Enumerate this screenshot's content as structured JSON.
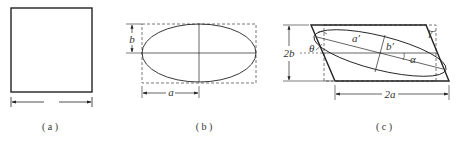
{
  "panels": [
    {
      "id": "a",
      "caption": "( a )"
    },
    {
      "id": "b",
      "caption": "( b )",
      "labels": {
        "semi_minor": "b",
        "semi_major": "a"
      }
    },
    {
      "id": "c",
      "caption": "( c )",
      "labels": {
        "height": "2b",
        "width": "2a",
        "semi_major_prime": "a′",
        "semi_minor_prime": "b′",
        "rotation": "α",
        "shear_angle": "θ",
        "shear_strain": "γ"
      }
    }
  ],
  "colors": {
    "stroke": "#222222",
    "dashed": "#555555"
  }
}
